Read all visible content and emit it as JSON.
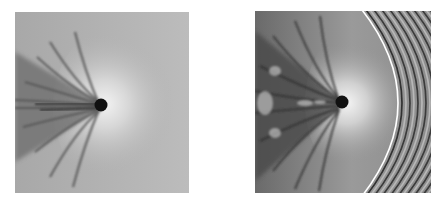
{
  "figure": {
    "panels": [
      {
        "id": "left",
        "description": "Grayscale shadowgraph of a sphere with turbulent wake (subsonic)",
        "sphere_center": [
          101,
          103
        ],
        "colors": {
          "background": "#b4b4b4",
          "sphere": "#111111",
          "wake": "#555555",
          "highlight": "#ececec"
        }
      },
      {
        "id": "right",
        "description": "Grayscale shadowgraph of a sphere with bow shock wave fringes and turbulent wake",
        "sphere_center": [
          342,
          102
        ],
        "colors": {
          "background": "#8a8a8a",
          "sphere": "#111111",
          "wake": "#3c3c3c",
          "highlight": "#f0f0f0",
          "fringe_dark": "#3a3a3a",
          "fringe_light": "#b8b8b8"
        },
        "fringe_count": 10
      }
    ]
  }
}
